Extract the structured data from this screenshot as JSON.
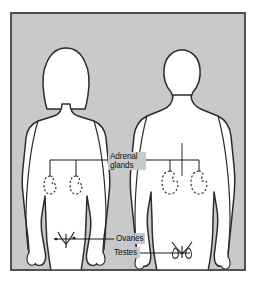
{
  "figure": {
    "name": "endocrine-glands-diagram",
    "caption_absent": true,
    "panel": {
      "background_color": "#c9c9c9",
      "border_color": "#4a4a4a",
      "outer_background": "#ffffff"
    },
    "body_fill_color": "#ffffff",
    "outline_color": "#2b2b2b",
    "leader_line_color": "#1a1a1a",
    "gland_outline_style": "dashed"
  },
  "subjects": [
    {
      "id": "female-figure",
      "name": "female-body-silhouette",
      "sex": "female",
      "hair": "long",
      "position": "left"
    },
    {
      "id": "male-figure",
      "name": "male-body-silhouette",
      "sex": "male",
      "hair": "short",
      "position": "right"
    }
  ],
  "labels": {
    "adrenal": {
      "line1": "Adrenal",
      "line2": "glands"
    },
    "ovaries": "Ovaries",
    "testes": "Testes"
  },
  "organs": [
    {
      "id": "adrenal-female-left",
      "name": "adrenal-gland-marker",
      "belongs_to": "female-figure",
      "label_ref": "adrenal"
    },
    {
      "id": "adrenal-female-right",
      "name": "adrenal-gland-marker",
      "belongs_to": "female-figure",
      "label_ref": "adrenal"
    },
    {
      "id": "adrenal-male-left",
      "name": "adrenal-gland-marker",
      "belongs_to": "male-figure",
      "label_ref": "adrenal"
    },
    {
      "id": "adrenal-male-right",
      "name": "adrenal-gland-marker",
      "belongs_to": "male-figure",
      "label_ref": "adrenal"
    },
    {
      "id": "ovary-left",
      "name": "ovary-marker",
      "belongs_to": "female-figure",
      "label_ref": "ovaries"
    },
    {
      "id": "ovary-right",
      "name": "ovary-marker",
      "belongs_to": "female-figure",
      "label_ref": "ovaries"
    },
    {
      "id": "testis-left",
      "name": "testis-marker",
      "belongs_to": "male-figure",
      "label_ref": "testes"
    },
    {
      "id": "testis-right",
      "name": "testis-marker",
      "belongs_to": "male-figure",
      "label_ref": "testes"
    }
  ]
}
